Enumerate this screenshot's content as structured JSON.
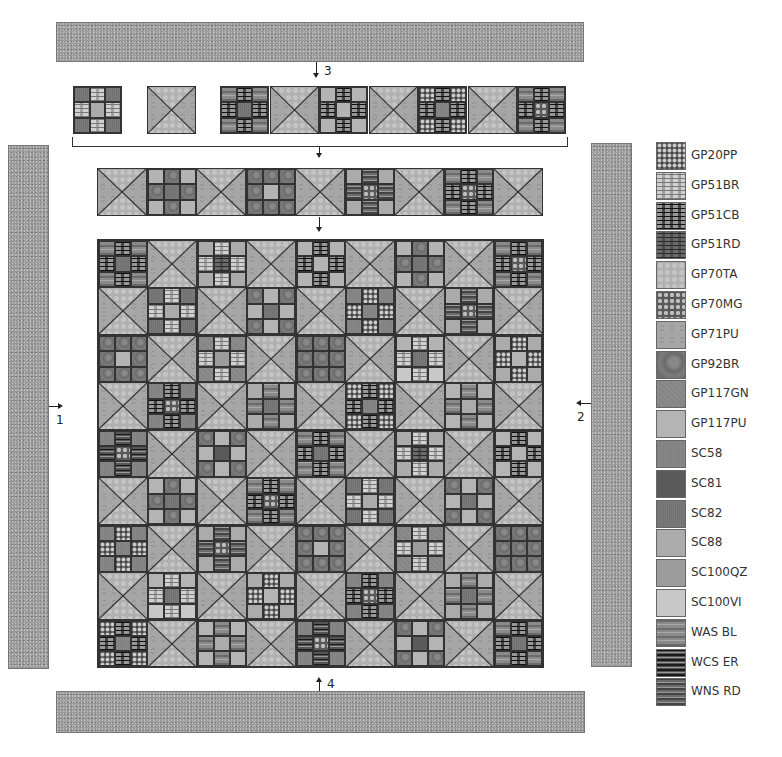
{
  "diagram": {
    "steps": [
      {
        "id": "1",
        "label": "1",
        "description": "Left side border",
        "arrow": "right"
      },
      {
        "id": "2",
        "label": "2",
        "description": "Right side border",
        "arrow": "left"
      },
      {
        "id": "3",
        "label": "3",
        "description": "Top border",
        "arrow": "down"
      },
      {
        "id": "4",
        "label": "4",
        "description": "Bottom border",
        "arrow": "up"
      }
    ],
    "border_fabric": "GP117PU",
    "grid": {
      "rows": 9,
      "cols": 9,
      "layout": "alternating nine-patch and hourglass blocks"
    },
    "hourglass_fabrics": {
      "top_bottom": "GP70TA",
      "left_right": "GP71PU"
    }
  },
  "legend": {
    "items": [
      {
        "code": "GP20PP",
        "cls": "f-GP20PP"
      },
      {
        "code": "GP51BR",
        "cls": "f-GP51BR"
      },
      {
        "code": "GP51CB",
        "cls": "f-GP51CB"
      },
      {
        "code": "GP51RD",
        "cls": "f-GP51RD"
      },
      {
        "code": "GP70TA",
        "cls": "f-GP70TA"
      },
      {
        "code": "GP70MG",
        "cls": "f-GP70MG"
      },
      {
        "code": "GP71PU",
        "cls": "f-GP71PU"
      },
      {
        "code": "GP92BR",
        "cls": "f-GP92BR"
      },
      {
        "code": "GP117GN",
        "cls": "f-GP117GN"
      },
      {
        "code": "GP117PU",
        "cls": "f-GP117PU"
      },
      {
        "code": "SC58",
        "cls": "f-SC58"
      },
      {
        "code": "SC81",
        "cls": "f-SC81"
      },
      {
        "code": "SC82",
        "cls": "f-SC82"
      },
      {
        "code": "SC88",
        "cls": "f-SC88"
      },
      {
        "code": "SC100QZ",
        "cls": "f-SC100QZ"
      },
      {
        "code": "SC100VI",
        "cls": "f-SC100VI"
      },
      {
        "code": "WAS BL",
        "cls": "f-WASBL"
      },
      {
        "code": "WCS ER",
        "cls": "f-WCSER"
      },
      {
        "code": "WNS RD",
        "cls": "f-WNSRD"
      }
    ]
  },
  "ninepatches": [
    [
      "WAS BL",
      "GP51CB",
      "WAS BL",
      "GP51CB",
      "SC82",
      "GP51CB",
      "WAS BL",
      "GP51CB",
      "WAS BL"
    ],
    [
      "SC88",
      "GP51BR",
      "SC88",
      "GP51BR",
      "GP51RD",
      "GP51BR",
      "SC88",
      "GP51BR",
      "SC88"
    ],
    [
      "GP117PU",
      "GP51CB",
      "GP117PU",
      "GP51CB",
      "GP117PU",
      "GP51CB",
      "GP117PU",
      "GP51CB",
      "GP117PU"
    ],
    [
      "GP117PU",
      "GP92BR",
      "GP117PU",
      "GP92BR",
      "SC82",
      "GP92BR",
      "GP117PU",
      "GP92BR",
      "GP117PU"
    ],
    [
      "WAS BL",
      "GP51CB",
      "WAS BL",
      "GP51CB",
      "GP70MG",
      "GP51CB",
      "WAS BL",
      "GP51CB",
      "WAS BL"
    ],
    [
      "SC82",
      "GP51BR",
      "SC82",
      "GP51BR",
      "SC88",
      "GP51BR",
      "SC82",
      "GP51BR",
      "SC82"
    ],
    [
      "GP92BR",
      "GP117PU",
      "GP92BR",
      "GP117PU",
      "SC82",
      "GP117PU",
      "GP92BR",
      "GP117PU",
      "GP92BR"
    ],
    [
      "SC58",
      "GP20PP",
      "SC58",
      "GP20PP",
      "SC58",
      "GP20PP",
      "SC58",
      "GP20PP",
      "SC58"
    ],
    [
      "SC88",
      "WNS RD",
      "SC88",
      "WNS RD",
      "GP70MG",
      "WNS RD",
      "SC88",
      "WNS RD",
      "SC88"
    ],
    [
      "GP92BR",
      "GP92BR",
      "GP92BR",
      "GP92BR",
      "GP117PU",
      "GP92BR",
      "GP92BR",
      "GP92BR",
      "GP92BR"
    ],
    [
      "GP117GN",
      "GP51BR",
      "GP117GN",
      "GP51BR",
      "SC100QZ",
      "GP51BR",
      "GP117GN",
      "GP51BR",
      "GP117GN"
    ],
    [
      "GP92BR",
      "GP92BR",
      "GP92BR",
      "GP92BR",
      "GP92BR",
      "GP92BR",
      "GP92BR",
      "GP92BR",
      "GP92BR"
    ],
    [
      "GP117PU",
      "GP51BR",
      "GP117PU",
      "GP51BR",
      "SC82",
      "GP51BR",
      "SC100VI",
      "GP51BR",
      "SC100VI"
    ],
    [
      "SC88",
      "GP20PP",
      "SC88",
      "GP20PP",
      "GP117PU",
      "GP20PP",
      "SC88",
      "GP20PP",
      "SC88"
    ],
    [
      "SC58",
      "GP51CB",
      "SC58",
      "GP51CB",
      "GP70MG",
      "GP51CB",
      "SC58",
      "GP51CB",
      "SC58"
    ],
    [
      "SC88",
      "WAS BL",
      "SC88",
      "WAS BL",
      "SC82",
      "WAS BL",
      "SC88",
      "WAS BL",
      "SC88"
    ],
    [
      "GP20PP",
      "GP51CB",
      "GP20PP",
      "GP51CB",
      "SC58",
      "GP51CB",
      "GP20PP",
      "GP51CB",
      "GP20PP"
    ],
    [
      "GP117PU",
      "WAS BL",
      "GP117PU",
      "WAS BL",
      "SC88",
      "WAS BL",
      "GP117PU",
      "WAS BL",
      "GP117PU"
    ],
    [
      "SC58",
      "WCS ER",
      "SC58",
      "WCS ER",
      "GP70MG",
      "WCS ER",
      "SC58",
      "WCS ER",
      "SC58"
    ],
    [
      "GP92BR",
      "GP117PU",
      "GP92BR",
      "GP117PU",
      "SC81",
      "GP117PU",
      "GP92BR",
      "GP117PU",
      "GP92BR"
    ]
  ]
}
